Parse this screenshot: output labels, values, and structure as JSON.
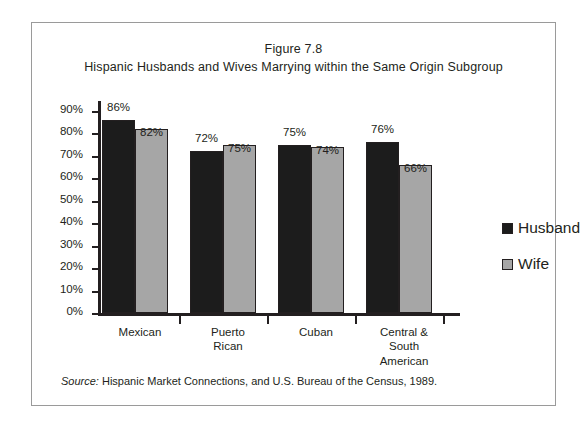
{
  "figure": {
    "title_line1": "Figure 7.8",
    "title_line2": "Hispanic Husbands and Wives Marrying within the Same Origin Subgroup",
    "source_prefix": "Source:",
    "source_text": " Hispanic Market Connections, and U.S. Bureau of the Census, 1989."
  },
  "colors": {
    "husband": "#1c1c1c",
    "wife": "#a6a6a6",
    "ink": "#231f20",
    "frame": "#9a9a9a"
  },
  "chart_data": {
    "type": "bar",
    "xlabel": "",
    "ylabel": "",
    "ylim": [
      0,
      90
    ],
    "grid": false,
    "legend_position": "right",
    "categories": [
      "Mexican",
      "Puerto Rican",
      "Cuban",
      "Central & South American"
    ],
    "category_lines": [
      [
        "Mexican"
      ],
      [
        "Puerto",
        "Rican"
      ],
      [
        "Cuban"
      ],
      [
        "Central &",
        "South",
        "American"
      ]
    ],
    "ticks": [
      "0%",
      "10%",
      "20%",
      "30%",
      "40%",
      "50%",
      "60%",
      "70%",
      "80%",
      "90%"
    ],
    "tick_values": [
      0,
      10,
      20,
      30,
      40,
      50,
      60,
      70,
      80,
      90
    ],
    "series": [
      {
        "name": "Husband",
        "values": [
          86,
          72,
          75,
          76
        ],
        "labels": [
          "86%",
          "72%",
          "75%",
          "76%"
        ]
      },
      {
        "name": "Wife",
        "values": [
          82,
          75,
          74,
          66
        ],
        "labels": [
          "82%",
          "75%",
          "74%",
          "66%"
        ]
      }
    ]
  }
}
